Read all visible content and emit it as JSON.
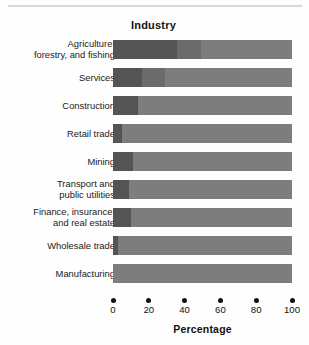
{
  "figure": {
    "axis_title": "Percentage",
    "category_header": "Industry"
  },
  "chart_data": {
    "type": "bar",
    "orientation": "horizontal",
    "stacked": true,
    "title": "",
    "xlabel": "Percentage",
    "ylabel": "Industry",
    "xlim": [
      0,
      100
    ],
    "xticks": [
      0,
      20,
      40,
      60,
      80,
      100
    ],
    "xtick_labels": [
      "0",
      "20",
      "40",
      "60",
      "80",
      "100"
    ],
    "grid": false,
    "legend": "none",
    "categories": [
      "Agriculture,\nforestry, and fishing",
      "Services",
      "Construction",
      "Retail trade",
      "Mining",
      "Transport and\npublic utilities",
      "Finance, insurance,\nand real estate",
      "Wholesale trade",
      "Manufacturing"
    ],
    "series": [
      {
        "name": "segment-1",
        "color": "#545454",
        "values": [
          36,
          16,
          14,
          5,
          11,
          9,
          10,
          3,
          0
        ]
      },
      {
        "name": "segment-2",
        "color": "#6b6b6b",
        "values": [
          13,
          13,
          0,
          0,
          0,
          0,
          0,
          0,
          0
        ]
      },
      {
        "name": "segment-3",
        "color": "#7d7d7d",
        "values": [
          51,
          71,
          86,
          95,
          89,
          91,
          90,
          97,
          100
        ]
      }
    ],
    "rows": [
      {
        "label": "Agriculture,\nforestry, and fishing",
        "segments": [
          36,
          13,
          51
        ]
      },
      {
        "label": "Services",
        "segments": [
          16,
          13,
          71
        ]
      },
      {
        "label": "Construction",
        "segments": [
          14,
          0,
          86
        ]
      },
      {
        "label": "Retail trade",
        "segments": [
          5,
          0,
          95
        ]
      },
      {
        "label": "Mining",
        "segments": [
          11,
          0,
          89
        ]
      },
      {
        "label": "Transport and\npublic utilities",
        "segments": [
          9,
          0,
          91
        ]
      },
      {
        "label": "Finance, insurance,\nand real estate",
        "segments": [
          10,
          0,
          90
        ]
      },
      {
        "label": "Wholesale trade",
        "segments": [
          3,
          0,
          97
        ]
      },
      {
        "label": "Manufacturing",
        "segments": [
          0,
          0,
          100
        ]
      }
    ]
  }
}
